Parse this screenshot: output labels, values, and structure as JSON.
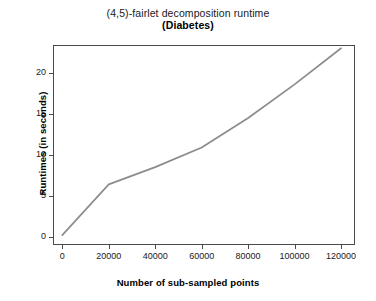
{
  "chart_data": {
    "type": "line",
    "title": "(4,5)-fairlet decomposition runtime",
    "subtitle": "(Diabetes)",
    "xlabel": "Number of sub-sampled points",
    "ylabel": "Runtimes (in seconds)",
    "x": [
      0,
      20000,
      40000,
      60000,
      80000,
      100000,
      120000
    ],
    "values": [
      0.2,
      6.4,
      8.5,
      10.9,
      14.5,
      18.6,
      23.0
    ],
    "series": [
      {
        "name": "Diabetes runtime",
        "values": [
          0.2,
          6.4,
          8.5,
          10.9,
          14.5,
          18.6,
          23.0
        ],
        "color": "#8c8c8c"
      }
    ],
    "xticks": [
      0,
      20000,
      40000,
      60000,
      80000,
      100000,
      120000
    ],
    "xtick_labels": [
      "0",
      "20000",
      "40000",
      "60000",
      "80000",
      "100000",
      "120000"
    ],
    "yticks": [
      0,
      5,
      10,
      15,
      20
    ],
    "ytick_labels": [
      "0",
      "5",
      "10",
      "15",
      "20"
    ],
    "xlim": [
      -4000,
      126000
    ],
    "ylim": [
      -1.0,
      23.4
    ],
    "grid": false,
    "legend": null,
    "line_color": "#8c8c8c",
    "frame_color": "#4a4a4a",
    "background": "#ffffff"
  }
}
